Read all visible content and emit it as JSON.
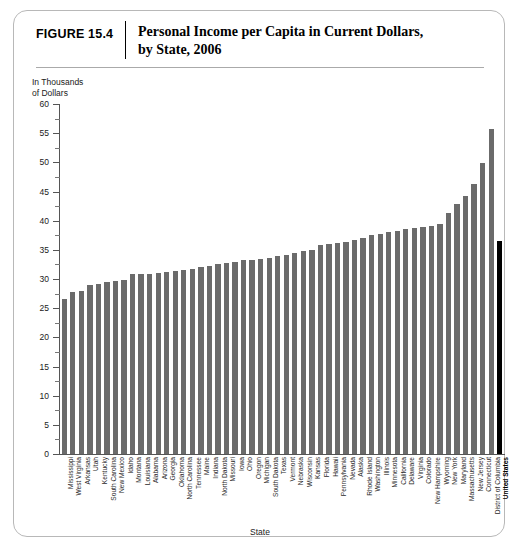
{
  "figure": {
    "number_label": "FIGURE 15.4",
    "title_line1": "Personal Income per Capita in Current Dollars,",
    "title_line2": "by State, 2006"
  },
  "colors": {
    "bar": "#6b6b6b",
    "highlight_bar": "#000000",
    "axis": "#555555",
    "card_border": "#b8b8b8"
  },
  "chart_data": {
    "type": "bar",
    "title": "Personal Income per Capita in Current Dollars, by State, 2006",
    "xlabel": "State",
    "ylabel": "In Thousands\nof Dollars",
    "ylim": [
      0,
      60
    ],
    "ytick_step": 5,
    "yticks": [
      0,
      5,
      10,
      15,
      20,
      25,
      30,
      35,
      40,
      45,
      50,
      55,
      60
    ],
    "ytick_labels": [
      "0",
      "5",
      "10",
      "15",
      "20",
      "25",
      "30",
      "35",
      "40",
      "45",
      "50",
      "55",
      "60"
    ],
    "minor_ticks": true,
    "grid": false,
    "legend": "none",
    "highlight_category": "United States",
    "categories": [
      "Mississippi",
      "West Virginia",
      "Arkansas",
      "Utah",
      "Kentucky",
      "South Carolina",
      "New Mexico",
      "Idaho",
      "Montana",
      "Louisiana",
      "Alabama",
      "Arizona",
      "Georgia",
      "Oklahoma",
      "North Carolina",
      "Tennessee",
      "Maine",
      "Indiana",
      "North Dakota",
      "Missouri",
      "Iowa",
      "Ohio",
      "Oregon",
      "Michigan",
      "South Dakota",
      "Texas",
      "Vermont",
      "Nebraska",
      "Wisconsin",
      "Kansas",
      "Florida",
      "Hawaii",
      "Pennsylvania",
      "Nevada",
      "Alaska",
      "Rhode Island",
      "Washington",
      "Illinois",
      "Minnesota",
      "California",
      "Delaware",
      "Virginia",
      "Colorado",
      "New Hampshire",
      "Wyoming",
      "New York",
      "Maryland",
      "Massachusetts",
      "New Jersey",
      "Connecticut",
      "District of Columbia",
      "United States"
    ],
    "values": [
      26.5,
      27.8,
      27.9,
      29.0,
      29.2,
      29.5,
      29.6,
      29.9,
      30.8,
      30.9,
      30.9,
      31.0,
      31.2,
      31.3,
      31.6,
      31.8,
      32.0,
      32.3,
      32.5,
      32.8,
      33.0,
      33.2,
      33.3,
      33.4,
      33.6,
      34.0,
      34.2,
      34.5,
      34.8,
      35.0,
      35.8,
      36.0,
      36.2,
      36.4,
      36.7,
      37.1,
      37.6,
      37.8,
      38.1,
      38.2,
      38.6,
      38.8,
      39.0,
      39.1,
      39.5,
      41.4,
      42.8,
      44.3,
      46.3,
      49.9,
      55.8,
      36.5
    ]
  }
}
